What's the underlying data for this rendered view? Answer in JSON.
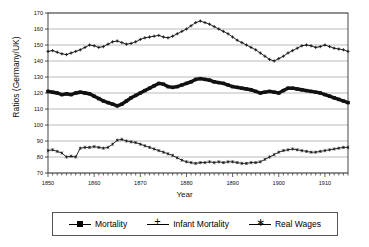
{
  "chart_data": {
    "type": "line",
    "title": "",
    "xlabel": "Year",
    "ylabel": "Ratios (Germany/UK)",
    "xlim": [
      1850,
      1915
    ],
    "ylim": [
      70,
      170
    ],
    "ytick_step": 10,
    "yticks": [
      70,
      80,
      90,
      100,
      110,
      120,
      130,
      140,
      150,
      160,
      170
    ],
    "xticks": [
      1850,
      1860,
      1870,
      1880,
      1890,
      1900,
      1910
    ],
    "xtick_labels": [
      "1850",
      "1860",
      "1870",
      "1880",
      "1890",
      "1900",
      "1910"
    ],
    "ytick_labels": [
      "70",
      "80",
      "90",
      "100",
      "110",
      "120",
      "130",
      "140",
      "150",
      "160",
      "170"
    ],
    "minor_xtick_step": 1,
    "grid": "horizontal",
    "legend_position": "bottom",
    "x": [
      1850,
      1851,
      1852,
      1853,
      1854,
      1855,
      1856,
      1857,
      1858,
      1859,
      1860,
      1861,
      1862,
      1863,
      1864,
      1865,
      1866,
      1867,
      1868,
      1869,
      1870,
      1871,
      1872,
      1873,
      1874,
      1875,
      1876,
      1877,
      1878,
      1879,
      1880,
      1881,
      1882,
      1883,
      1884,
      1885,
      1886,
      1887,
      1888,
      1889,
      1890,
      1891,
      1892,
      1893,
      1894,
      1895,
      1896,
      1897,
      1898,
      1899,
      1900,
      1901,
      1902,
      1903,
      1904,
      1905,
      1906,
      1907,
      1908,
      1909,
      1910,
      1911,
      1912,
      1913,
      1914,
      1915
    ],
    "series": [
      {
        "name": "Mortality",
        "marker": "square",
        "values": [
          121,
          120.5,
          120,
          119,
          119.5,
          119,
          120,
          120.5,
          120,
          119.5,
          118,
          116.5,
          115,
          114,
          113,
          112,
          113,
          115,
          117,
          118.5,
          120,
          121.5,
          123,
          124.5,
          126,
          125.5,
          124,
          123.5,
          124,
          125,
          126,
          127,
          128.5,
          129,
          128.5,
          128,
          127,
          126.5,
          126,
          125,
          124,
          123.5,
          123,
          122.5,
          122,
          121,
          120,
          120.5,
          121,
          120.5,
          120,
          121.5,
          123,
          123,
          122.5,
          122,
          121.5,
          121,
          120.5,
          120,
          119,
          118,
          117,
          116,
          115,
          114
        ],
        "color": "#111111"
      },
      {
        "name": "Infant Mortality",
        "marker": "plus",
        "values": [
          146,
          146.5,
          145.5,
          144.5,
          144,
          145,
          146,
          147,
          148.5,
          150,
          149.5,
          148.5,
          149,
          150.5,
          152,
          152.5,
          151.5,
          150.5,
          151,
          152,
          153.5,
          154.5,
          155,
          155.5,
          156,
          155,
          154.5,
          155.5,
          157,
          158.5,
          160,
          162,
          164,
          165,
          164,
          163,
          161.5,
          160,
          158.5,
          157,
          155,
          153,
          151.5,
          150,
          148.5,
          147,
          145,
          143,
          141,
          140,
          141.5,
          143,
          145,
          146.5,
          148,
          149.5,
          150,
          149.5,
          148.5,
          149,
          150,
          149,
          148,
          147.5,
          147,
          146
        ],
        "color": "#111111"
      },
      {
        "name": "Real Wages",
        "marker": "star",
        "values": [
          84,
          84.5,
          83.5,
          82.5,
          80,
          80.5,
          80,
          85.5,
          86,
          86,
          86.5,
          86,
          85.5,
          86,
          88,
          90.5,
          91,
          90,
          89.5,
          89,
          88,
          87,
          86,
          85,
          84,
          83,
          82,
          81,
          79.5,
          78,
          77,
          76.5,
          76,
          76.5,
          76.5,
          77,
          76.5,
          77,
          76.5,
          77,
          77,
          76.5,
          76,
          76,
          76.5,
          76.5,
          77,
          78.5,
          80,
          81.5,
          83,
          84,
          84.5,
          85,
          84.5,
          84,
          83.5,
          83,
          83,
          83.5,
          84,
          84.5,
          85,
          85.5,
          86,
          86
        ],
        "color": "#111111"
      }
    ]
  },
  "axis": {
    "y_title": "Ratios (Germany/UK)",
    "x_title": "Year"
  },
  "legend": {
    "items": [
      {
        "label": "Mortality",
        "marker": "square-marker"
      },
      {
        "label": "Infant Mortality",
        "marker": "plus-marker"
      },
      {
        "label": "Real Wages",
        "marker": "star-marker"
      }
    ]
  }
}
